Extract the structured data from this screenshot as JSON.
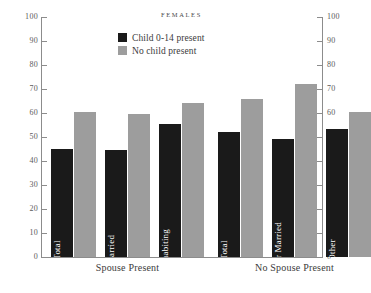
{
  "chart_data": {
    "type": "bar",
    "title": "FEMALES",
    "xlabel": "",
    "ylabel": "",
    "ylim": [
      0,
      100
    ],
    "yticks": [
      0,
      10,
      20,
      30,
      40,
      50,
      60,
      70,
      80,
      90,
      100
    ],
    "grid": false,
    "legend_position": "top-center",
    "dual_y_axis": true,
    "categories": [
      "Total",
      "Married",
      "Cohabiting",
      "Total",
      "Never Married",
      "Other"
    ],
    "groups": [
      {
        "label": "Spouse Present",
        "categories": [
          "Total",
          "Married",
          "Cohabiting"
        ]
      },
      {
        "label": "No Spouse Present",
        "categories": [
          "Total",
          "Never Married",
          "Other"
        ]
      }
    ],
    "series": [
      {
        "name": "Child 0-14 present",
        "color": "#1a1a1a",
        "values": [
          45,
          44.5,
          55.5,
          52,
          49,
          53.5
        ]
      },
      {
        "name": "No child present",
        "color": "#9d9d9d",
        "values": [
          60.5,
          59.5,
          64,
          66,
          72,
          60.5
        ]
      }
    ]
  },
  "axis": {
    "left_labels": [
      "100",
      "90",
      "80",
      "70",
      "60",
      "50",
      "40",
      "30",
      "20",
      "10",
      "0"
    ],
    "right_labels": [
      "100",
      "90",
      "80",
      "70",
      "60",
      "50",
      "40",
      "30",
      "20",
      "10",
      "0"
    ]
  },
  "legend": {
    "items": [
      {
        "label": "Child 0-14 present",
        "color": "#1a1a1a"
      },
      {
        "label": "No child present",
        "color": "#9d9d9d"
      }
    ]
  },
  "bars": [
    {
      "name": "Total",
      "group": "Spouse Present",
      "dark": 45,
      "light": 60.5
    },
    {
      "name": "Married",
      "group": "Spouse Present",
      "dark": 44.5,
      "light": 59.5
    },
    {
      "name": "Cohabiting",
      "group": "Spouse Present",
      "dark": 55.5,
      "light": 64
    },
    {
      "name": "Total",
      "group": "No Spouse Present",
      "dark": 52,
      "light": 66
    },
    {
      "name": "Never Married",
      "group": "No Spouse Present",
      "dark": 49,
      "light": 72
    },
    {
      "name": "Other",
      "group": "No Spouse Present",
      "dark": 53.5,
      "light": 60.5
    }
  ],
  "groups": [
    {
      "label": "Spouse Present"
    },
    {
      "label": "No Spouse Present"
    }
  ]
}
